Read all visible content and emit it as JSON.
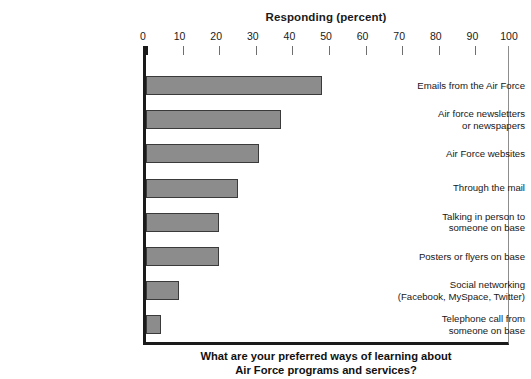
{
  "chart_data": {
    "type": "bar",
    "orientation": "horizontal",
    "title": "Responding (percent)",
    "xlabel": "Responding (percent)",
    "ylabel": "",
    "xlim": [
      0,
      100
    ],
    "xticks": [
      0,
      10,
      20,
      30,
      40,
      50,
      60,
      70,
      80,
      90,
      100
    ],
    "grid": false,
    "legend": null,
    "categories": [
      "Emails from the Air Force",
      "Air force newsletters or newspapers",
      "Air Force websites",
      "Through the mail",
      "Talking in person to someone on base",
      "Posters or flyers on base",
      "Social networking (Facebook, MySpace, Twitter)",
      "Telephone call from someone on base"
    ],
    "category_lines": [
      [
        "Emails from the Air Force"
      ],
      [
        "Air force newsletters",
        "or newspapers"
      ],
      [
        "Air Force websites"
      ],
      [
        "Through the mail"
      ],
      [
        "Talking in person to",
        "someone on base"
      ],
      [
        "Posters or flyers on base"
      ],
      [
        "Social networking",
        "(Facebook, MySpace, Twitter)"
      ],
      [
        "Telephone call from",
        "someone on base"
      ]
    ],
    "values": [
      48,
      37,
      31,
      25,
      20,
      20,
      9,
      4
    ],
    "caption_lines": [
      "What are your preferred ways of learning about",
      "Air Force programs and services?"
    ],
    "colors": {
      "bar_fill": "#8c8c8c",
      "bar_stroke": "#3a3a3a",
      "axis": "#1a1a1a",
      "frame_right": "#8d8d8d",
      "text": "#171717",
      "background": "#ffffff"
    }
  }
}
